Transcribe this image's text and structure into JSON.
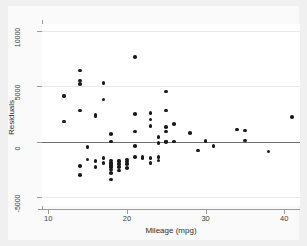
{
  "chart_data": {
    "type": "scatter",
    "title": "",
    "xlabel": "Mileage (mpg)",
    "ylabel": "Residuals",
    "xlim": [
      9.2,
      42.0
    ],
    "ylim": [
      -5800,
      10600
    ],
    "xticks": [
      10,
      20,
      30,
      40
    ],
    "xtick_labels": [
      "10",
      "20",
      "30",
      "40"
    ],
    "yticks": [
      -5000,
      0,
      5000,
      10000
    ],
    "ytick_labels": [
      "-5000",
      "0",
      "5000",
      "10000"
    ],
    "grid": "horizontal-light",
    "legend": "none",
    "reference_line": {
      "orientation": "horizontal",
      "y": 0,
      "color": "#6e6e6e"
    },
    "marker": {
      "shape": "circle",
      "color": "#1a1a1a",
      "size": 3.6
    },
    "points": [
      [
        12,
        4100
      ],
      [
        12,
        1800
      ],
      [
        14,
        6400
      ],
      [
        14,
        5500
      ],
      [
        14,
        5200
      ],
      [
        14,
        2800
      ],
      [
        14,
        -2200
      ],
      [
        14,
        -3000
      ],
      [
        15,
        -500
      ],
      [
        15,
        -1600
      ],
      [
        16,
        2400
      ],
      [
        16,
        2300
      ],
      [
        16,
        -1700
      ],
      [
        16,
        -1800
      ],
      [
        16,
        -2300
      ],
      [
        17,
        5300
      ],
      [
        17,
        3800
      ],
      [
        17,
        -1500
      ],
      [
        17,
        -1900
      ],
      [
        18,
        700
      ],
      [
        18,
        0
      ],
      [
        18,
        -1700
      ],
      [
        18,
        -1900
      ],
      [
        18,
        -2100
      ],
      [
        18,
        -2300
      ],
      [
        18,
        -2500
      ],
      [
        18,
        -2800
      ],
      [
        18,
        -3400
      ],
      [
        19,
        -1700
      ],
      [
        19,
        -1800
      ],
      [
        19,
        -2000
      ],
      [
        19,
        -2300
      ],
      [
        19,
        -2600
      ],
      [
        20,
        -1600
      ],
      [
        20,
        -1800
      ],
      [
        20,
        -2000
      ],
      [
        20,
        -2400
      ],
      [
        21,
        7600
      ],
      [
        21,
        2500
      ],
      [
        21,
        900
      ],
      [
        21,
        -400
      ],
      [
        21,
        -1400
      ],
      [
        22,
        -1400
      ],
      [
        22,
        -1500
      ],
      [
        23,
        2600
      ],
      [
        23,
        2000
      ],
      [
        23,
        1400
      ],
      [
        23,
        -1500
      ],
      [
        23,
        -1900
      ],
      [
        24,
        400
      ],
      [
        24,
        -100
      ],
      [
        24,
        -1400
      ],
      [
        24,
        -1700
      ],
      [
        25,
        4500
      ],
      [
        25,
        2800
      ],
      [
        25,
        1300
      ],
      [
        25,
        900
      ],
      [
        25,
        0
      ],
      [
        25,
        -50
      ],
      [
        26,
        1600
      ],
      [
        26,
        0
      ],
      [
        28,
        800
      ],
      [
        29,
        -800
      ],
      [
        30,
        100
      ],
      [
        30,
        0
      ],
      [
        31,
        -400
      ],
      [
        34,
        1100
      ],
      [
        35,
        1000
      ],
      [
        35,
        100
      ],
      [
        38,
        -900
      ],
      [
        41,
        2200
      ]
    ]
  },
  "figure": {
    "background": "#f0f0f0",
    "canvas_background": "#fafafa",
    "plot_background": "#ffffff",
    "axis_color": "#9a9a9a",
    "grid_color": "#e9e9e9"
  }
}
